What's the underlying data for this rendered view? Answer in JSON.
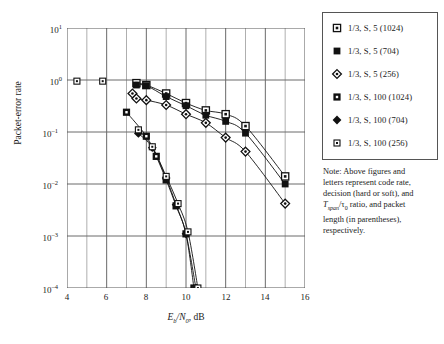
{
  "figure": {
    "y_axis_label": "Packet-error rate",
    "x_axis_label_num": "E",
    "x_axis_label_sub1": "b",
    "x_axis_label_den": "N",
    "x_axis_label_sub2": "0",
    "x_axis_label_unit": ", dB"
  },
  "legend": {
    "items": [
      {
        "label": "1/3, S, 5 (1024)",
        "marker": "open-square-dot-icon",
        "key": "S5-1024"
      },
      {
        "label": "1/3, S, 5 (704)",
        "marker": "filled-square-icon",
        "key": "S5-704"
      },
      {
        "label": "1/3, S, 5 (256)",
        "marker": "open-diamond-dot-icon",
        "key": "S5-256"
      },
      {
        "label": "1/3, S, 100 (1024)",
        "marker": "filled-square-dot-icon",
        "key": "S100-1024"
      },
      {
        "label": "1/3, S, 100 (704)",
        "marker": "filled-diamond-icon",
        "key": "S100-704"
      },
      {
        "label": "1/3, S, 100 (256)",
        "marker": "small-open-square-dot-icon",
        "key": "S100-256"
      }
    ]
  },
  "note": {
    "line1": "Note: Above figures and",
    "line2": "letters represent code rate,",
    "line3": "decision (hard or soft), and",
    "line4_pre": "T",
    "line4_sub": "span",
    "line4_mid": "/τ",
    "line4_sub2": "0",
    "line4_post": " ratio, and packet",
    "line5": "length (in parentheses),",
    "line6": "respectively."
  },
  "chart_data": {
    "type": "scatter",
    "title": "",
    "xlabel": "Eb/N0, dB",
    "ylabel": "Packet-error rate",
    "xlim": [
      4,
      16
    ],
    "ylim": [
      0.0001,
      10
    ],
    "yscale": "log",
    "grid": true,
    "legend_position": "outside-right-top",
    "xticks": [
      4,
      6,
      8,
      10,
      12,
      14,
      16
    ],
    "yticks": [
      0.0001,
      0.001,
      0.01,
      0.1,
      1,
      10
    ],
    "yticklabels": [
      "10^-4",
      "10^-3",
      "10^-2",
      "10^-1",
      "10^0",
      "10^1"
    ],
    "xticklabels": [
      "4",
      "6",
      "8",
      "10",
      "12",
      "14",
      "16"
    ],
    "series": [
      {
        "name": "1/3, S, 5 (1024)",
        "marker": "open-square-dot",
        "x": [
          7.5,
          8.0,
          9.0,
          10.0,
          11.0,
          12.0,
          13.0,
          15.0
        ],
        "y": [
          0.87,
          0.8,
          0.55,
          0.36,
          0.26,
          0.22,
          0.13,
          0.014
        ]
      },
      {
        "name": "1/3, S, 5 (704)",
        "marker": "filled-square",
        "x": [
          7.5,
          8.0,
          9.0,
          10.0,
          11.0,
          12.0,
          13.0,
          15.0
        ],
        "y": [
          0.8,
          0.78,
          0.48,
          0.32,
          0.21,
          0.16,
          0.095,
          0.01
        ]
      },
      {
        "name": "1/3, S, 5 (256)",
        "marker": "open-diamond-dot",
        "x": [
          7.3,
          7.5,
          8.0,
          9.0,
          10.0,
          11.0,
          12.0,
          13.0,
          15.0
        ],
        "y": [
          0.55,
          0.44,
          0.41,
          0.33,
          0.22,
          0.15,
          0.078,
          0.042,
          0.0042
        ]
      },
      {
        "name": "1/3, S, 100 (1024)",
        "marker": "filled-square-dot",
        "x": [
          7.0,
          8.0,
          8.5,
          9.0,
          9.5,
          10.0,
          10.4
        ],
        "y": [
          0.24,
          0.083,
          0.034,
          0.012,
          0.0038,
          0.0011,
          0.0001
        ]
      },
      {
        "name": "1/3, S, 100 (704)",
        "marker": "filled-diamond",
        "x": [
          7.6,
          8.3,
          9.0,
          9.5,
          10.0,
          10.5
        ],
        "y": [
          0.094,
          0.05,
          0.013,
          0.004,
          0.0011,
          0.0001
        ]
      },
      {
        "name": "1/3, S, 100 (256)",
        "marker": "small-open-square-dot",
        "x": [
          4.5,
          5.8,
          7.6,
          8.3,
          9.0,
          9.6,
          10.1,
          10.6
        ],
        "y": [
          0.95,
          0.95,
          0.11,
          0.052,
          0.014,
          0.0042,
          0.0012,
          0.0001
        ]
      }
    ],
    "extra_points": [
      {
        "series": "1/3, S, 100 (256)",
        "x": 4.5,
        "y": 0.95
      },
      {
        "series": "1/3, S, 100 (256)",
        "x": 5.8,
        "y": 0.95
      }
    ]
  }
}
